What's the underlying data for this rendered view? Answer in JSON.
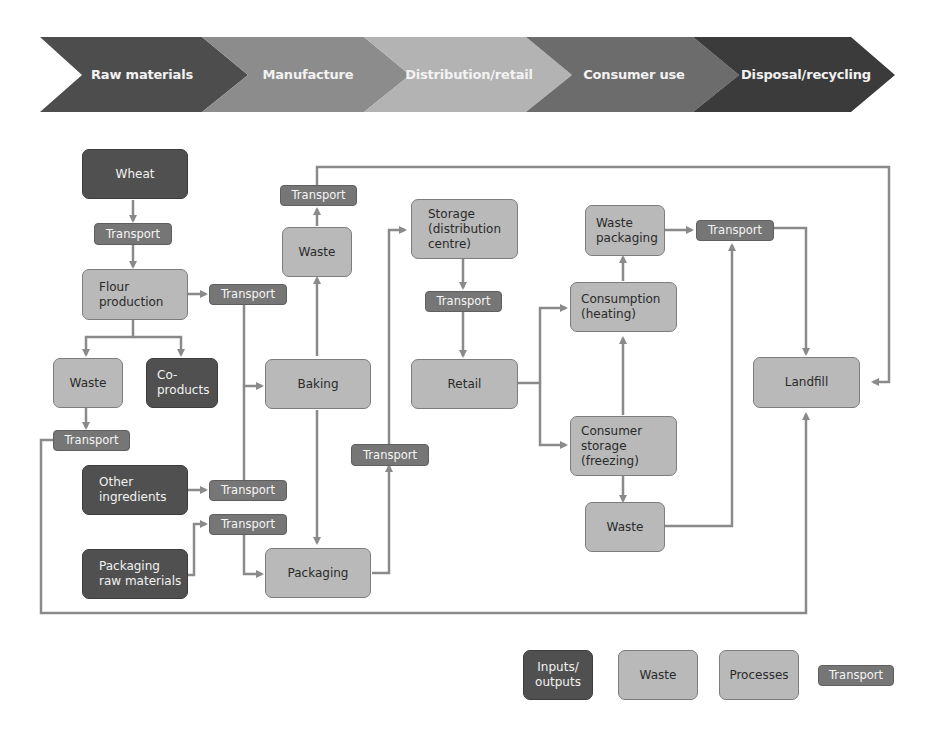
{
  "stages": [
    {
      "label": "Raw materials",
      "color": "#4d4d4d"
    },
    {
      "label": "Manufacture",
      "color": "#8c8c8c"
    },
    {
      "label": "Distribution/retail",
      "color": "#b3b3b3"
    },
    {
      "label": "Consumer use",
      "color": "#6c6c6c"
    },
    {
      "label": "Disposal/recycling",
      "color": "#3b3b3b"
    }
  ],
  "nodes": {
    "wheat": "Wheat",
    "transport_wheat": "Transport",
    "flour_production": "Flour\nproduction",
    "transport_flour": "Transport",
    "waste_flour": "Waste",
    "co_products": "Co-\nproducts",
    "transport_waste_flour": "Transport",
    "other_ingredients": "Other\ningredients",
    "transport_other": "Transport",
    "packaging_raw_materials": "Packaging\nraw materials",
    "transport_packaging_raw": "Transport",
    "transport_bake_waste": "Transport",
    "waste_baking": "Waste",
    "baking": "Baking",
    "packaging": "Packaging",
    "transport_packaging": "Transport",
    "storage_distribution": "Storage\n(distribution\ncentre)",
    "transport_storage": "Transport",
    "retail": "Retail",
    "waste_packaging": "Waste\npackaging",
    "transport_consumer_waste": "Transport",
    "consumption_heating": "Consumption\n(heating)",
    "consumer_storage": "Consumer\nstorage\n(freezing)",
    "waste_consumer": "Waste",
    "landfill": "Landfill"
  },
  "legend": [
    {
      "label": "Inputs/\noutputs",
      "type": "inputs-outputs"
    },
    {
      "label": "Waste",
      "type": "waste"
    },
    {
      "label": "Processes",
      "type": "processes"
    },
    {
      "label": "Transport",
      "type": "transport"
    }
  ],
  "colors": {
    "process_fill": "#b9b9b9",
    "io_fill": "#505050",
    "transport_fill": "#767676",
    "connector": "#8a8a8a"
  }
}
